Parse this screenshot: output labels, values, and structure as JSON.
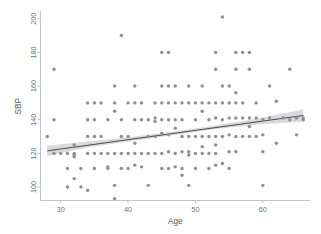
{
  "chart_data": {
    "type": "scatter",
    "title": "",
    "xlabel": "Age",
    "ylabel": "SBP",
    "xlim": [
      27,
      67
    ],
    "ylim": [
      92,
      204
    ],
    "xticks": [
      30,
      40,
      50,
      60
    ],
    "yticks": [
      100,
      120,
      140,
      160,
      180,
      200
    ],
    "grid": false,
    "legend": null,
    "point_color": "#8e8e96",
    "line_color": "#4a4a4f",
    "band_color": "#b9b9c0",
    "axis_color": "#bcbcc0",
    "background_color": "#ffffff",
    "regression": {
      "type": "linear-fit-with-confidence-band",
      "x_start": 28,
      "x_end": 66,
      "y_start": 121.5,
      "y_end": 142.5,
      "slope": 0.553,
      "intercept": 106.0,
      "band_lower": [
        118.5,
        123.5,
        127.0,
        130.5,
        134.0,
        137.0,
        139.0
      ],
      "band_upper": [
        124.5,
        127.0,
        129.5,
        132.5,
        136.0,
        140.5,
        146.0
      ],
      "band_x": [
        28,
        34,
        40,
        46,
        52,
        59,
        66
      ]
    },
    "points": [
      [
        28,
        130
      ],
      [
        29,
        140
      ],
      [
        29,
        170
      ],
      [
        29,
        120
      ],
      [
        30,
        120
      ],
      [
        31,
        120
      ],
      [
        31,
        100
      ],
      [
        31,
        111
      ],
      [
        32,
        120
      ],
      [
        32,
        118
      ],
      [
        32,
        125
      ],
      [
        32,
        105
      ],
      [
        32,
        119
      ],
      [
        33,
        100
      ],
      [
        33,
        111
      ],
      [
        34,
        150
      ],
      [
        34,
        140
      ],
      [
        34,
        98
      ],
      [
        34,
        130
      ],
      [
        34,
        120
      ],
      [
        35,
        150
      ],
      [
        35,
        140
      ],
      [
        35,
        120
      ],
      [
        35,
        111
      ],
      [
        35,
        130
      ],
      [
        36,
        150
      ],
      [
        36,
        120
      ],
      [
        36,
        130
      ],
      [
        37,
        140
      ],
      [
        37,
        111
      ],
      [
        37,
        120
      ],
      [
        37,
        112
      ],
      [
        38,
        160
      ],
      [
        38,
        145
      ],
      [
        38,
        150
      ],
      [
        38,
        120
      ],
      [
        38,
        93
      ],
      [
        38,
        101
      ],
      [
        39,
        190
      ],
      [
        39,
        140
      ],
      [
        39,
        130
      ],
      [
        39,
        111
      ],
      [
        39,
        120
      ],
      [
        40,
        150
      ],
      [
        40,
        130
      ],
      [
        40,
        120
      ],
      [
        40,
        111
      ],
      [
        41,
        160
      ],
      [
        41,
        150
      ],
      [
        41,
        140
      ],
      [
        41,
        126
      ],
      [
        41,
        113
      ],
      [
        41,
        120
      ],
      [
        42,
        150
      ],
      [
        42,
        140
      ],
      [
        42,
        120
      ],
      [
        42,
        112
      ],
      [
        43,
        140
      ],
      [
        43,
        130
      ],
      [
        43,
        120
      ],
      [
        43,
        101
      ],
      [
        44,
        141
      ],
      [
        44,
        139
      ],
      [
        44,
        130
      ],
      [
        44,
        120
      ],
      [
        44,
        150
      ],
      [
        45,
        180
      ],
      [
        45,
        160
      ],
      [
        45,
        150
      ],
      [
        45,
        140
      ],
      [
        45,
        132
      ],
      [
        45,
        120
      ],
      [
        45,
        111
      ],
      [
        46,
        180
      ],
      [
        46,
        160
      ],
      [
        46,
        150
      ],
      [
        46,
        140
      ],
      [
        46,
        131
      ],
      [
        46,
        121
      ],
      [
        46,
        111
      ],
      [
        47,
        160
      ],
      [
        47,
        150
      ],
      [
        47,
        140
      ],
      [
        47,
        135
      ],
      [
        47,
        120
      ],
      [
        47,
        112
      ],
      [
        48,
        150
      ],
      [
        48,
        140
      ],
      [
        48,
        130
      ],
      [
        48,
        121
      ],
      [
        48,
        111
      ],
      [
        48,
        107
      ],
      [
        49,
        160
      ],
      [
        49,
        150
      ],
      [
        49,
        130
      ],
      [
        49,
        121
      ],
      [
        49,
        119
      ],
      [
        49,
        101
      ],
      [
        50,
        150
      ],
      [
        50,
        140
      ],
      [
        50,
        130
      ],
      [
        50,
        120
      ],
      [
        50,
        111
      ],
      [
        51,
        160
      ],
      [
        51,
        150
      ],
      [
        51,
        145
      ],
      [
        51,
        130
      ],
      [
        51,
        124
      ],
      [
        51,
        120
      ],
      [
        52,
        150
      ],
      [
        52,
        140
      ],
      [
        52,
        130
      ],
      [
        52,
        120
      ],
      [
        52,
        111
      ],
      [
        53,
        180
      ],
      [
        53,
        170
      ],
      [
        53,
        150
      ],
      [
        53,
        141
      ],
      [
        53,
        130
      ],
      [
        53,
        125
      ],
      [
        53,
        120
      ],
      [
        53,
        113
      ],
      [
        54,
        201
      ],
      [
        54,
        160
      ],
      [
        54,
        150
      ],
      [
        54,
        140
      ],
      [
        54,
        130
      ],
      [
        54,
        114
      ],
      [
        55,
        160
      ],
      [
        55,
        150
      ],
      [
        55,
        141
      ],
      [
        55,
        131
      ],
      [
        55,
        121
      ],
      [
        55,
        111
      ],
      [
        56,
        180
      ],
      [
        56,
        170
      ],
      [
        56,
        156
      ],
      [
        56,
        150
      ],
      [
        56,
        141
      ],
      [
        56,
        130
      ],
      [
        56,
        121
      ],
      [
        57,
        180
      ],
      [
        57,
        150
      ],
      [
        57,
        141
      ],
      [
        57,
        130
      ],
      [
        58,
        180
      ],
      [
        58,
        170
      ],
      [
        58,
        141
      ],
      [
        58,
        136
      ],
      [
        58,
        130
      ],
      [
        59,
        150
      ],
      [
        59,
        141
      ],
      [
        59,
        130
      ],
      [
        60,
        140
      ],
      [
        60,
        131
      ],
      [
        60,
        121
      ],
      [
        60,
        101
      ],
      [
        61,
        160
      ],
      [
        61,
        141
      ],
      [
        62,
        151
      ],
      [
        62,
        126
      ],
      [
        63,
        141
      ],
      [
        64,
        170
      ],
      [
        64,
        140
      ],
      [
        65,
        141
      ],
      [
        65,
        131
      ],
      [
        66,
        141
      ],
      [
        66,
        140
      ]
    ]
  },
  "axes": {
    "x_title": "Age",
    "y_title": "SBP",
    "x_tick_labels": [
      "30",
      "40",
      "50",
      "60"
    ],
    "y_tick_labels": [
      "100",
      "120",
      "140",
      "160",
      "180",
      "200"
    ]
  }
}
